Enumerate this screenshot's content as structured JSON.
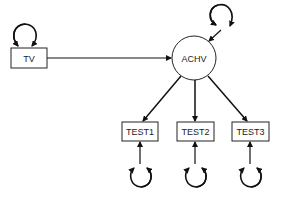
{
  "diagram": {
    "type": "path-diagram",
    "nodes": {
      "tv": {
        "label": "TV",
        "shape": "rectangle"
      },
      "achv": {
        "label": "ACHV",
        "shape": "circle"
      },
      "test1": {
        "label": "TEST1",
        "shape": "rectangle"
      },
      "test2": {
        "label": "TEST2",
        "shape": "rectangle"
      },
      "test3": {
        "label": "TEST3",
        "shape": "rectangle"
      }
    },
    "edges": [
      {
        "from": "TV",
        "to": "ACHV",
        "type": "directed"
      },
      {
        "from": "ACHV",
        "to": "TEST1",
        "type": "directed"
      },
      {
        "from": "ACHV",
        "to": "TEST2",
        "type": "directed"
      },
      {
        "from": "ACHV",
        "to": "TEST3",
        "type": "directed"
      }
    ],
    "variance_loops": [
      "TV",
      "ACHV-disturbance",
      "TEST1-error",
      "TEST2-error",
      "TEST3-error"
    ],
    "colors": {
      "stroke": "#111111",
      "fill": "#ffffff"
    }
  }
}
